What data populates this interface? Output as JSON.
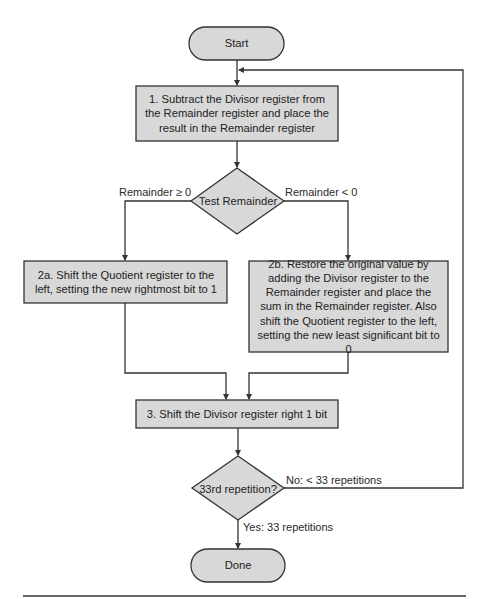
{
  "diagram": {
    "type": "flowchart",
    "colors": {
      "fill": "#d8d8d8",
      "stroke": "#333333",
      "line": "#333333",
      "text": "#222222"
    },
    "nodes": {
      "start": {
        "shape": "terminator",
        "label": "Start"
      },
      "step1": {
        "shape": "process",
        "label": "1. Subtract the Divisor register from the Remainder register and place the result in the Remainder register"
      },
      "test_remainder": {
        "shape": "decision",
        "label": "Test Remainder"
      },
      "step2a": {
        "shape": "process",
        "label": "2a. Shift the Quotient register to the left, setting the new rightmost bit to 1"
      },
      "step2b": {
        "shape": "process",
        "label": "2b. Restore the original value by adding the Divisor register to the Remainder register and place the sum in the Remainder register. Also shift the Quotient register to the left, setting the new least significant bit to 0"
      },
      "step3": {
        "shape": "process",
        "label": "3. Shift the Divisor register right 1 bit"
      },
      "repetition_check": {
        "shape": "decision",
        "label": "33rd repetition?"
      },
      "done": {
        "shape": "terminator",
        "label": "Done"
      }
    },
    "edges": {
      "remainder_ge_0": {
        "from": "test_remainder",
        "to": "step2a",
        "label": "Remainder ≥ 0"
      },
      "remainder_lt_0": {
        "from": "test_remainder",
        "to": "step2b",
        "label": "Remainder < 0"
      },
      "no_loop": {
        "from": "repetition_check",
        "to": "step1",
        "label": "No:  < 33 repetitions"
      },
      "yes_done": {
        "from": "repetition_check",
        "to": "done",
        "label": "Yes:  33 repetitions"
      }
    }
  }
}
